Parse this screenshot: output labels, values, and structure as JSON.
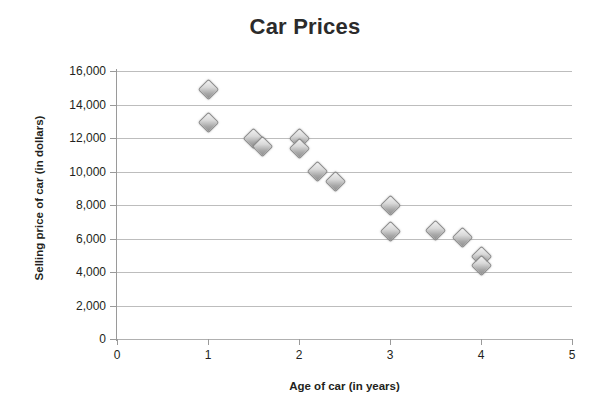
{
  "chart_data": {
    "type": "scatter",
    "title": "Car Prices",
    "xlabel": "Age of car (in years)",
    "ylabel": "Selling price of car (in dollars)",
    "xlim": [
      0,
      5
    ],
    "ylim": [
      0,
      16000
    ],
    "grid": true,
    "legend": "none",
    "x_ticks": [
      "0",
      "1",
      "2",
      "3",
      "4",
      "5"
    ],
    "x_tick_values": [
      0,
      1,
      2,
      3,
      4,
      5
    ],
    "y_ticks": [
      "0",
      "2,000",
      "4,000",
      "6,000",
      "8,000",
      "10,000",
      "12,000",
      "14,000",
      "16,000"
    ],
    "y_tick_values": [
      0,
      2000,
      4000,
      6000,
      8000,
      10000,
      12000,
      14000,
      16000
    ],
    "marker": "diamond",
    "marker_color": "#a8a8a8",
    "points": [
      {
        "x": 1.0,
        "y": 14900
      },
      {
        "x": 1.0,
        "y": 12950
      },
      {
        "x": 1.5,
        "y": 12000
      },
      {
        "x": 1.6,
        "y": 11500
      },
      {
        "x": 2.0,
        "y": 12000
      },
      {
        "x": 2.0,
        "y": 11400
      },
      {
        "x": 2.2,
        "y": 10000
      },
      {
        "x": 2.4,
        "y": 9400
      },
      {
        "x": 3.0,
        "y": 8000
      },
      {
        "x": 3.0,
        "y": 6400
      },
      {
        "x": 3.5,
        "y": 6500
      },
      {
        "x": 3.8,
        "y": 6050
      },
      {
        "x": 4.0,
        "y": 4900
      },
      {
        "x": 4.0,
        "y": 4400
      }
    ]
  }
}
